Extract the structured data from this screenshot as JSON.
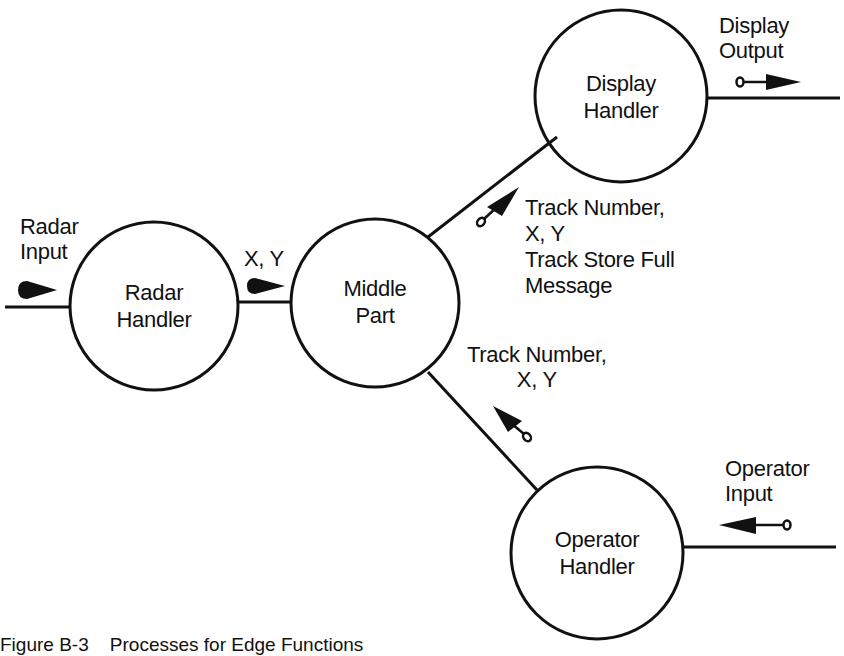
{
  "figure": {
    "caption": "Figure B-3    Processes for Edge Functions",
    "colors": {
      "ink": "#111111",
      "background": "#ffffff"
    }
  },
  "nodes": [
    {
      "id": "radar-handler",
      "lines": [
        "Radar",
        "Handler"
      ],
      "cx": 154,
      "cy": 306,
      "r": 84
    },
    {
      "id": "middle-part",
      "lines": [
        "Middle",
        "Part"
      ],
      "cx": 375,
      "cy": 303,
      "r": 84
    },
    {
      "id": "display-handler",
      "lines": [
        "Display",
        "Handler"
      ],
      "cx": 621,
      "cy": 96,
      "r": 86
    },
    {
      "id": "operator-handler",
      "lines": [
        "Operator",
        "Handler"
      ],
      "cx": 597,
      "cy": 553,
      "r": 86
    }
  ],
  "flows": {
    "radar_input": {
      "lines": [
        "Radar",
        "Input"
      ],
      "direction": "into radar-handler"
    },
    "radar_to_middle": {
      "lines": [
        "X, Y"
      ],
      "direction": "radar-handler to middle-part"
    },
    "middle_to_display": {
      "lines": [
        "Track Number,",
        "X, Y",
        "Track Store Full",
        "Message"
      ],
      "direction": "middle-part to display-handler"
    },
    "operator_to_middle": {
      "lines": [
        "Track Number,",
        "X, Y"
      ],
      "direction": "operator-handler to middle-part"
    },
    "display_output": {
      "lines": [
        "Display",
        "Output"
      ],
      "direction": "out of display-handler"
    },
    "operator_input": {
      "lines": [
        "Operator",
        "Input"
      ],
      "direction": "into operator-handler"
    }
  },
  "icons": {
    "data_flow_arrow": "solid-triangle-arrow",
    "control_flow_arrow": "circle-tailed-arrow"
  }
}
